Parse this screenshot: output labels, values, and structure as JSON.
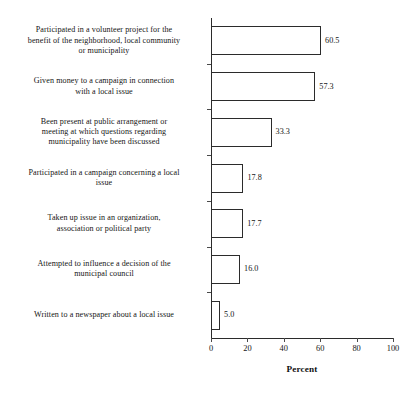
{
  "chart_data": {
    "type": "bar",
    "orientation": "horizontal",
    "title": "",
    "xlabel": "Percent",
    "ylabel": "",
    "xlim": [
      0,
      100
    ],
    "xticks": [
      0,
      20,
      40,
      60,
      80,
      100
    ],
    "xtick_labels": [
      "0",
      "20",
      "40",
      "60",
      "80",
      "100"
    ],
    "grid": false,
    "legend": null,
    "categories": [
      "Participated in a volunteer project for the benefit of the neighborhood, local community or municipality",
      "Given money to a campaign in connection with a local issue",
      "Been present at public arrangement or meeting at which questions regarding municipality have been discussed",
      "Participated in a campaign concerning a local issue",
      "Taken up issue in an organization, association or political party",
      "Attempted to influence a decision of the municipal council",
      "Written to a newspaper about a local issue"
    ],
    "values": [
      60.5,
      57.3,
      33.3,
      17.8,
      17.7,
      16.0,
      5.0
    ],
    "value_labels": [
      "60.5",
      "57.3",
      "33.3",
      "17.8",
      "17.7",
      "16.0",
      "5.0"
    ],
    "bar_face_color": "#ffffff",
    "bar_edge_color": "#2b2b2b",
    "axis_color": "#2b2b2b"
  },
  "category_label_lines": [
    [
      "Participated in a volunteer project for the",
      "benefit of the neighborhood, local community",
      "or municipality"
    ],
    [
      "Given money to a campaign in connection",
      "with a local issue"
    ],
    [
      "Been present at public arrangement or",
      "meeting at which questions regarding",
      "municipality have been discussed"
    ],
    [
      "Participated in a campaign concerning a local",
      "issue"
    ],
    [
      "Taken up issue in an organization,",
      "association or political party"
    ],
    [
      "Attempted to influence a decision of the",
      "municipal council"
    ],
    [
      "Written to a newspaper about a local issue"
    ]
  ]
}
